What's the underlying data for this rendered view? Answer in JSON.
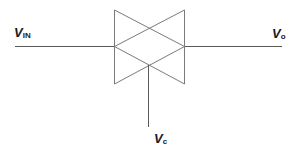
{
  "diagram": {
    "type": "transmission-gate",
    "labels": {
      "input": {
        "main": "V",
        "sub": "IN"
      },
      "output": {
        "main": "V",
        "sub": "o"
      },
      "control": {
        "main": "V",
        "sub": "c"
      }
    },
    "colors": {
      "wire": "#5a5a5a",
      "gate": "#7a7a7a",
      "text": "#1a1a1a",
      "background": "#ffffff"
    }
  }
}
